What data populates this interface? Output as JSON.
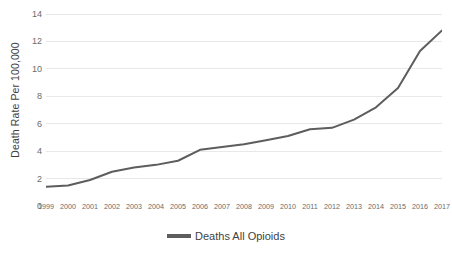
{
  "chart_data": {
    "type": "line",
    "title": "",
    "xlabel": "",
    "ylabel": "Death Rate Per 100,000",
    "legend_position": "bottom",
    "grid": true,
    "x": [
      1999,
      2000,
      2001,
      2002,
      2003,
      2004,
      2005,
      2006,
      2007,
      2008,
      2009,
      2010,
      2011,
      2012,
      2013,
      2014,
      2015,
      2016,
      2017
    ],
    "categories": [
      "1999",
      "2000",
      "2001",
      "2002",
      "2003",
      "2004",
      "2005",
      "2006",
      "2007",
      "2008",
      "2009",
      "2010",
      "2011",
      "2012",
      "2013",
      "2014",
      "2015",
      "2016",
      "2017"
    ],
    "series": [
      {
        "name": "Deaths All Opioids",
        "color": "#5d5d5d",
        "values": [
          1.4,
          1.5,
          1.9,
          2.5,
          2.8,
          3.0,
          3.3,
          4.1,
          4.3,
          4.5,
          4.8,
          5.1,
          5.6,
          5.7,
          6.3,
          7.2,
          8.6,
          11.3,
          12.8
        ]
      }
    ],
    "ylim": [
      0,
      14
    ],
    "yticks": [
      0,
      2,
      4,
      6,
      8,
      10,
      12,
      14
    ],
    "ytick_labels": [
      "0",
      "2",
      "4",
      "6",
      "8",
      "10",
      "12",
      "14"
    ],
    "xlim": [
      1999,
      2017
    ],
    "gridline_color": "#e8e8e8",
    "background_color": "#ffffff",
    "axis_label_color": "#6b6b6b"
  },
  "legend": {
    "entries": [
      {
        "label": "Deaths All Opioids",
        "color": "#5d5d5d"
      }
    ]
  }
}
